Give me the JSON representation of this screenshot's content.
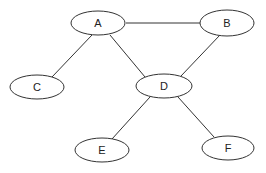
{
  "diagram": {
    "type": "undirected-graph",
    "nodes": [
      {
        "id": "A",
        "label": "A",
        "cx": 98,
        "cy": 23,
        "rx": 27,
        "ry": 12
      },
      {
        "id": "B",
        "label": "B",
        "cx": 227,
        "cy": 23,
        "rx": 27,
        "ry": 13
      },
      {
        "id": "C",
        "label": "C",
        "cx": 37,
        "cy": 87,
        "rx": 27,
        "ry": 12
      },
      {
        "id": "D",
        "label": "D",
        "cx": 164,
        "cy": 86,
        "rx": 28,
        "ry": 12
      },
      {
        "id": "E",
        "label": "E",
        "cx": 102,
        "cy": 150,
        "rx": 27,
        "ry": 12
      },
      {
        "id": "F",
        "label": "F",
        "cx": 228,
        "cy": 148,
        "rx": 26,
        "ry": 12
      }
    ],
    "edges": [
      {
        "from": "A",
        "to": "B",
        "x1": 126,
        "y1": 23,
        "x2": 200,
        "y2": 23
      },
      {
        "from": "A",
        "to": "C",
        "x1": 92,
        "y1": 35,
        "x2": 52,
        "y2": 77
      },
      {
        "from": "A",
        "to": "D",
        "x1": 110,
        "y1": 35,
        "x2": 145,
        "y2": 77
      },
      {
        "from": "B",
        "to": "D",
        "x1": 220,
        "y1": 35,
        "x2": 181,
        "y2": 76
      },
      {
        "from": "D",
        "to": "E",
        "x1": 150,
        "y1": 97,
        "x2": 112,
        "y2": 139
      },
      {
        "from": "D",
        "to": "F",
        "x1": 178,
        "y1": 97,
        "x2": 214,
        "y2": 137
      }
    ]
  }
}
